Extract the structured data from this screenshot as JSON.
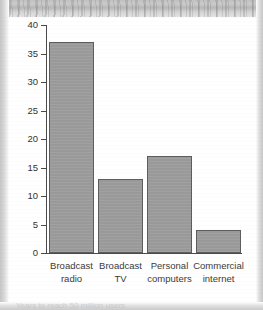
{
  "chart_data": {
    "type": "bar",
    "title": "",
    "subtitle": "",
    "xlabel": "",
    "ylabel": "",
    "categories": [
      "Broadcast radio",
      "Broadcast TV",
      "Personal computers",
      "Commercial internet"
    ],
    "category_lines": [
      [
        "Broadcast",
        "radio"
      ],
      [
        "Broadcast",
        "TV"
      ],
      [
        "Personal",
        "computers"
      ],
      [
        "Commercial",
        "internet"
      ]
    ],
    "values": [
      37,
      13,
      17,
      4
    ],
    "ylim": [
      0,
      40
    ],
    "ytick_labels": [
      "40",
      "35",
      "30",
      "25",
      "20",
      "15",
      "10",
      "5",
      "0"
    ],
    "ytick_values": [
      40,
      35,
      30,
      25,
      20,
      15,
      10,
      5,
      0
    ],
    "grid": false,
    "legend": null,
    "bar_color": "#9c9c9c",
    "bar_border_color": "#5d5d5d",
    "axis_color": "#4a4a4a",
    "text_color": "#333333",
    "background": "#ffffff"
  },
  "caption": {
    "text": "Years to reach 50 million users"
  }
}
